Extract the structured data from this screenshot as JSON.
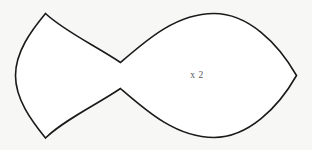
{
  "figure": {
    "name": "fish-shape-diagram",
    "background_color": "#f7f7f6",
    "fill_color": "#ffffff",
    "stroke_color": "#1a1a1a",
    "stroke_width": 1.6,
    "label": {
      "text": "x 2",
      "color": "#55555a",
      "x": 197,
      "y": 78
    },
    "outline_path": "M 45.5 13.5 C 64 31 96 46 120.5 62.5 C 146 40.5 176 13.5 214 13.5 C 248 13.5 278 43 296.5 75.5 C 278 108 248 137.5 214 137.5 C 176 137.5 146 110.5 120.5 88.5 C 96 105 64 120 45.5 138 C 31 120 15.5 99 15.5 75.5 C 15.5 52 31 31 45.5 13.5 Z",
    "vertices": {
      "tail_top_tip": [
        45.5,
        13.5
      ],
      "tail_bottom_tip": [
        45.5,
        138
      ],
      "tail_left_extreme": [
        15.5,
        75.5
      ],
      "waist_top": [
        120.5,
        62.5
      ],
      "waist_bottom": [
        120.5,
        88.5
      ],
      "body_top_apex": [
        214,
        13.5
      ],
      "body_bottom_apex": [
        214,
        137.5
      ],
      "nose_tip": [
        296.5,
        75.5
      ]
    }
  }
}
